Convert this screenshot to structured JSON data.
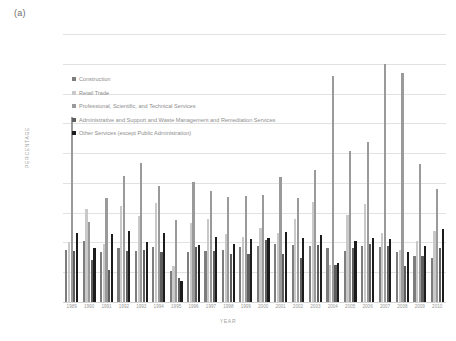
{
  "panel_label": "(a)",
  "axes": {
    "ylabel": "PERCENTAGE",
    "xlabel": "YEAR",
    "yticks": [
      "0.0%",
      "5.0%",
      "10.0%",
      "15.0%",
      "20.0%",
      "25.0%",
      "30.0%",
      "35.0%",
      "40.0%",
      "45.0%"
    ]
  },
  "legend": [
    {
      "label": "Construction",
      "color": "#7d7d7d"
    },
    {
      "label": "Retail Trade",
      "color": "#c9c9c9"
    },
    {
      "label": "Professional, Scientific, and Technical Services",
      "color": "#9a9a9a"
    },
    {
      "label": "Administrative and Support and Waste Management and Remediation Services",
      "color": "#5e5e5e"
    },
    {
      "label": "Other Services (except Public Administration)",
      "color": "#1c1c1c"
    }
  ],
  "chart_data": {
    "type": "bar",
    "title": "",
    "xlabel": "YEAR",
    "ylabel": "PERCENTAGE",
    "ylim": [
      0,
      45
    ],
    "ytick_step": 5,
    "grid": true,
    "legend_position": "inside-upper-left",
    "categories": [
      "1989",
      "1990",
      "1991",
      "1992",
      "1993",
      "1994",
      "1995",
      "1996",
      "1997",
      "1998",
      "1999",
      "2000",
      "2001",
      "2002",
      "2003",
      "2004",
      "2005",
      "2006",
      "2007",
      "2008",
      "2009",
      "2010"
    ],
    "series": [
      {
        "name": "Construction",
        "color": "#7d7d7d",
        "values": [
          8.8,
          10.2,
          8.4,
          9.0,
          8.6,
          9.2,
          5.2,
          8.4,
          8.5,
          8.8,
          9.2,
          9.4,
          9.8,
          9.6,
          9.4,
          9.0,
          8.6,
          9.4,
          9.2,
          8.4,
          7.8,
          7.4
        ]
      },
      {
        "name": "Retail Trade",
        "color": "#c9c9c9",
        "values": [
          10.0,
          15.6,
          9.8,
          16.2,
          14.4,
          16.6,
          6.0,
          13.2,
          14.0,
          11.4,
          11.0,
          12.4,
          11.6,
          14.0,
          16.8,
          6.2,
          14.6,
          16.4,
          11.6,
          8.8,
          10.2,
          12.0
        ]
      },
      {
        "name": "Professional, Scientific, and Technical Services",
        "color": "#9a9a9a",
        "values": [
          31.0,
          13.4,
          17.4,
          21.2,
          23.4,
          19.4,
          13.8,
          20.2,
          18.6,
          17.6,
          17.8,
          18.0,
          21.0,
          17.4,
          22.2,
          38.0,
          25.4,
          26.8,
          40.0,
          38.4,
          23.2,
          19.0
        ]
      },
      {
        "name": "Administrative and Support and Waste Management and Remediation Services",
        "color": "#5e5e5e",
        "values": [
          8.6,
          7.0,
          5.4,
          8.6,
          8.8,
          8.4,
          4.0,
          9.2,
          8.6,
          8.0,
          8.0,
          10.4,
          8.0,
          7.4,
          9.6,
          6.2,
          9.0,
          9.8,
          9.4,
          6.0,
          7.8,
          9.0
        ]
      },
      {
        "name": "Other Services (except Public Administration)",
        "color": "#1c1c1c",
        "values": [
          11.6,
          9.0,
          11.4,
          12.0,
          10.0,
          11.6,
          3.6,
          9.6,
          11.0,
          9.8,
          10.6,
          10.8,
          11.8,
          10.8,
          11.2,
          6.6,
          10.2,
          10.8,
          10.6,
          8.4,
          9.4,
          12.2
        ]
      }
    ]
  }
}
